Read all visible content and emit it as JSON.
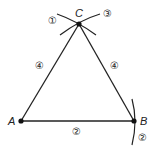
{
  "diagram": {
    "type": "geometric-construction",
    "points": [
      {
        "name": "A",
        "label": "A",
        "x": 21,
        "y": 121
      },
      {
        "name": "B",
        "label": "B",
        "x": 134,
        "y": 121
      },
      {
        "name": "C",
        "label": "C",
        "x": 79,
        "y": 24
      }
    ],
    "step_labels": {
      "arc_left_at_C": "①",
      "arc_right_at_C": "③",
      "side_AC": "④",
      "side_BC": "④",
      "side_AB": "②",
      "arc_at_B": "②"
    },
    "colors": {
      "stroke": "#222222",
      "background": "#ffffff"
    }
  }
}
